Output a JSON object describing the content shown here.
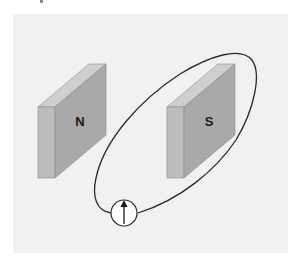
{
  "figure": {
    "colors": {
      "background": "#ffffff",
      "panel": "#f1f1f1",
      "magnet_front": "#a9a9a9",
      "magnet_side": "#bcbcbc",
      "magnet_top": "#cfcfcf",
      "magnet_edge": "#8c8c8c",
      "wire": "#2a2a2a",
      "meter_face": "#ffffff"
    },
    "magnets": [
      {
        "label": "N",
        "name": "north-magnet"
      },
      {
        "label": "S",
        "name": "south-magnet"
      }
    ],
    "galvanometer": {
      "needle_direction": "up"
    }
  }
}
